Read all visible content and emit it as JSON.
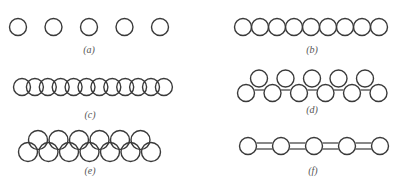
{
  "figure": {
    "panels": [
      {
        "id": "a",
        "label": "(a)",
        "description": "Five separated circles in a row",
        "circle_count": 5,
        "arrangement": "spaced"
      },
      {
        "id": "b",
        "label": "(b)",
        "description": "Nine circles touching in a row",
        "circle_count": 9,
        "arrangement": "touching"
      },
      {
        "id": "c",
        "label": "(c)",
        "description": "Twelve overlapping circles in a row",
        "circle_count": 12,
        "arrangement": "overlapping"
      },
      {
        "id": "d",
        "label": "(d)",
        "description": "Zigzag double row of touching circles (5 top, 6 bottom)",
        "circle_count": 11,
        "arrangement": "zigzag"
      },
      {
        "id": "e",
        "label": "(e)",
        "description": "Two overlapping interlocking rows (6 top, 7 bottom)",
        "circle_count": 13,
        "arrangement": "interlocked"
      },
      {
        "id": "f",
        "label": "(f)",
        "description": "Five circles linked by double bonds",
        "circle_count": 5,
        "arrangement": "bonded"
      }
    ],
    "stroke_color": "#3a3a3a",
    "label_color": "#555555"
  }
}
